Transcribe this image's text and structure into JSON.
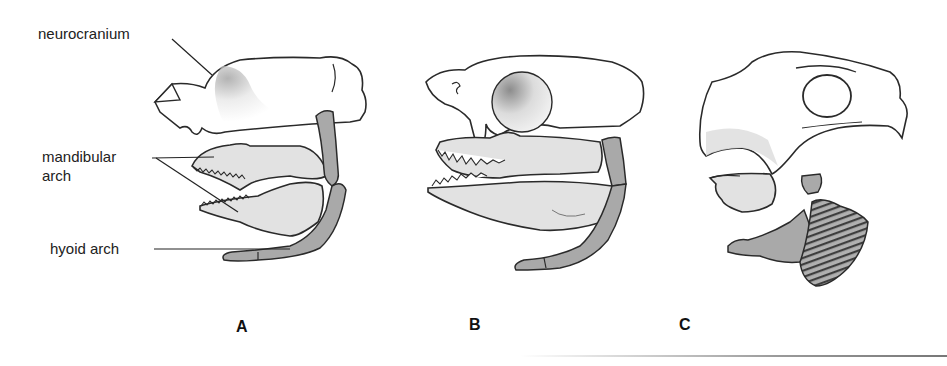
{
  "figure": {
    "labels": {
      "neurocranium": "neurocranium",
      "mandibular_line1": "mandibular",
      "mandibular_line2": "arch",
      "hyoid": "hyoid arch"
    },
    "panels": [
      {
        "letter": "A"
      },
      {
        "letter": "B"
      },
      {
        "letter": "C"
      }
    ],
    "colors": {
      "outline": "#2a2a2a",
      "neurocranium_fill": "#ffffff",
      "neurocranium_shade": "#c8c8c8",
      "mandibular_fill": "#e2e2e2",
      "hyoid_fill": "#a9a9a9",
      "gill_dark": "#5a5a5a"
    }
  }
}
